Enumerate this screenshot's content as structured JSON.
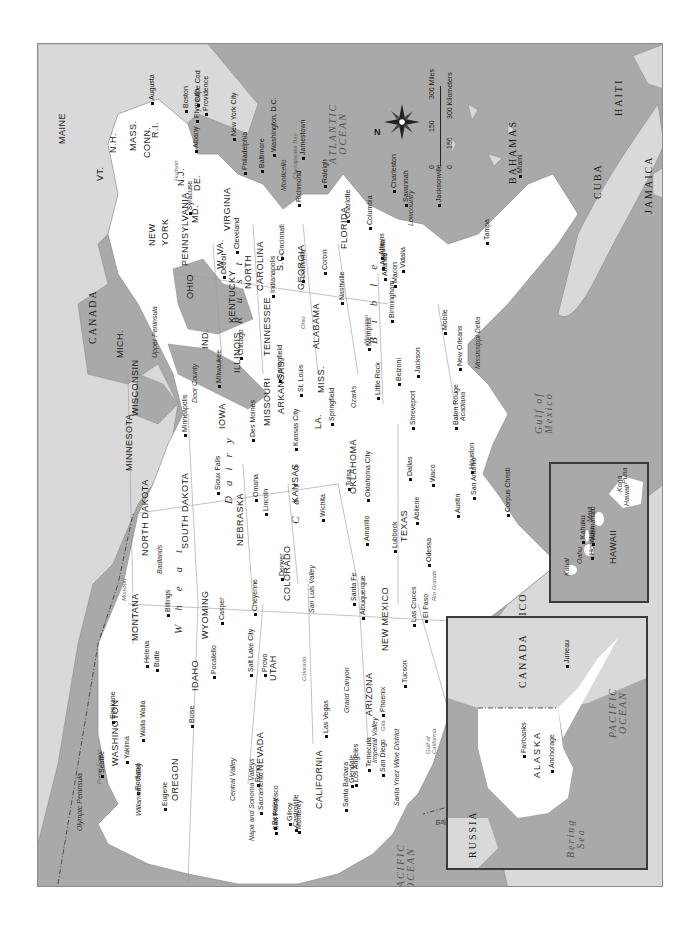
{
  "map": {
    "title": "United States regional map",
    "orientation": "rotated 90 degrees counter-clockwise (north points left)",
    "colors": {
      "water": "#a9a9a9",
      "foreign_land": "#d9d9d9",
      "us_land": "#ffffff",
      "border": "#8c8c8c",
      "text": "#1a1a1a"
    },
    "compass": {
      "north_label": "N"
    },
    "scale": {
      "miles_ticks": [
        "0",
        "150",
        "300 Miles"
      ],
      "km_ticks": [
        "0",
        "150",
        "300 Kilometers"
      ]
    },
    "countries": {
      "canada": "CANADA",
      "mexico": "MEXICO",
      "bahamas": "BAHAMAS",
      "cuba": "CUBA",
      "haiti": "HAITI",
      "jamaica": "JAMAICA",
      "sonora": "SONORA",
      "baja": "Baja California"
    },
    "water_bodies": {
      "atlantic": [
        "ATLANTIC",
        "OCEAN"
      ],
      "pacific": [
        "PACIFIC",
        "OCEAN"
      ],
      "gulf": [
        "Gulf of",
        "Mexico"
      ],
      "gulf_california": [
        "Gulf of",
        "California"
      ],
      "chesapeake": "Chesapeake Bay",
      "puget": "Puget Sound"
    },
    "states": [
      {
        "name": "MAINE",
        "x": 57,
        "y": 143
      },
      {
        "name": "VT.",
        "x": 95,
        "y": 180
      },
      {
        "name": "N.H.",
        "x": 108,
        "y": 152
      },
      {
        "name": "MASS.",
        "x": 128,
        "y": 150
      },
      {
        "name": "CONN.",
        "x": 142,
        "y": 157
      },
      {
        "name": "R.I.",
        "x": 150,
        "y": 137
      },
      {
        "name": "NEW",
        "x": 147,
        "y": 245
      },
      {
        "name": "YORK",
        "x": 160,
        "y": 245
      },
      {
        "name": "PENNSYLVANIA",
        "x": 180,
        "y": 265
      },
      {
        "name": "N.J.",
        "x": 176,
        "y": 185
      },
      {
        "name": "DE.",
        "x": 192,
        "y": 190
      },
      {
        "name": "MD.",
        "x": 190,
        "y": 222
      },
      {
        "name": "W. VA.",
        "x": 215,
        "y": 268
      },
      {
        "name": "VIRGINIA",
        "x": 222,
        "y": 230
      },
      {
        "name": "OHIO",
        "x": 185,
        "y": 298
      },
      {
        "name": "MICH.",
        "x": 115,
        "y": 357
      },
      {
        "name": "IND.",
        "x": 200,
        "y": 348
      },
      {
        "name": "ILLINOIS",
        "x": 232,
        "y": 372
      },
      {
        "name": "WISCONSIN",
        "x": 130,
        "y": 415
      },
      {
        "name": "MINNESOTA",
        "x": 124,
        "y": 470
      },
      {
        "name": "IOWA",
        "x": 217,
        "y": 428
      },
      {
        "name": "MISSOURI",
        "x": 262,
        "y": 425
      },
      {
        "name": "KENTUCKY",
        "x": 227,
        "y": 322
      },
      {
        "name": "TENNESSEE",
        "x": 262,
        "y": 355
      },
      {
        "name": "NORTH",
        "x": 243,
        "y": 288
      },
      {
        "name": "CAROLINA",
        "x": 255,
        "y": 290
      },
      {
        "name": "S.C.",
        "x": 275,
        "y": 270
      },
      {
        "name": "GEORGIA",
        "x": 296,
        "y": 289
      },
      {
        "name": "ALABAMA",
        "x": 311,
        "y": 348
      },
      {
        "name": "MISS.",
        "x": 316,
        "y": 392
      },
      {
        "name": "ARKANSAS",
        "x": 276,
        "y": 413
      },
      {
        "name": "LA.",
        "x": 313,
        "y": 428
      },
      {
        "name": "FLORIDA",
        "x": 339,
        "y": 248
      },
      {
        "name": "NORTH DAKOTA",
        "x": 140,
        "y": 555
      },
      {
        "name": "SOUTH DAKOTA",
        "x": 180,
        "y": 548
      },
      {
        "name": "NEBRASKA",
        "x": 235,
        "y": 545
      },
      {
        "name": "KANSAS",
        "x": 290,
        "y": 502
      },
      {
        "name": "OKLAHOMA",
        "x": 348,
        "y": 493
      },
      {
        "name": "TEXAS",
        "x": 399,
        "y": 541
      },
      {
        "name": "MONTANA",
        "x": 130,
        "y": 640
      },
      {
        "name": "WYOMING",
        "x": 200,
        "y": 638
      },
      {
        "name": "COLORADO",
        "x": 282,
        "y": 600
      },
      {
        "name": "NEW MEXICO",
        "x": 380,
        "y": 650
      },
      {
        "name": "IDAHO",
        "x": 190,
        "y": 690
      },
      {
        "name": "UTAH",
        "x": 268,
        "y": 680
      },
      {
        "name": "ARIZONA",
        "x": 364,
        "y": 715
      },
      {
        "name": "WASHINGTON",
        "x": 110,
        "y": 765
      },
      {
        "name": "OREGON",
        "x": 170,
        "y": 800
      },
      {
        "name": "NEVADA",
        "x": 255,
        "y": 770
      },
      {
        "name": "CALIFORNIA",
        "x": 314,
        "y": 808
      }
    ],
    "cities": [
      {
        "name": "Augusta",
        "x": 147,
        "y": 100
      },
      {
        "name": "Boston",
        "x": 181,
        "y": 108
      },
      {
        "name": "Cape Cod",
        "x": 193,
        "y": 102
      },
      {
        "name": "Plymouth",
        "x": 192,
        "y": 118
      },
      {
        "name": "Providence",
        "x": 201,
        "y": 111
      },
      {
        "name": "New York City",
        "x": 229,
        "y": 136
      },
      {
        "name": "Philadelphia",
        "x": 240,
        "y": 170
      },
      {
        "name": "Baltimore",
        "x": 257,
        "y": 168
      },
      {
        "name": "Washington, D.C.",
        "x": 269,
        "y": 152
      },
      {
        "name": "Jamestown",
        "x": 298,
        "y": 155
      },
      {
        "name": "Albany",
        "x": 191,
        "y": 148
      },
      {
        "name": "Syracuse",
        "x": 185,
        "y": 210
      },
      {
        "name": "Richmond",
        "x": 294,
        "y": 202
      },
      {
        "name": "Raleigh",
        "x": 320,
        "y": 183
      },
      {
        "name": "Charlotte",
        "x": 343,
        "y": 218
      },
      {
        "name": "Columbia",
        "x": 365,
        "y": 225
      },
      {
        "name": "Charleston",
        "x": 389,
        "y": 188
      },
      {
        "name": "Savannah",
        "x": 401,
        "y": 202
      },
      {
        "name": "Jacksonville",
        "x": 434,
        "y": 202
      },
      {
        "name": "Tampa",
        "x": 482,
        "y": 240
      },
      {
        "name": "Miami",
        "x": 515,
        "y": 173
      },
      {
        "name": "Cleveland",
        "x": 232,
        "y": 249
      },
      {
        "name": "Detroit",
        "x": 219,
        "y": 274
      },
      {
        "name": "Cincinnati",
        "x": 277,
        "y": 255
      },
      {
        "name": "Indianapolis",
        "x": 268,
        "y": 293
      },
      {
        "name": "Louisville",
        "x": 298,
        "y": 278
      },
      {
        "name": "Corbin",
        "x": 320,
        "y": 270
      },
      {
        "name": "Nashville",
        "x": 337,
        "y": 300
      },
      {
        "name": "Athens",
        "x": 377,
        "y": 255
      },
      {
        "name": "Augusta",
        "x": 378,
        "y": 265
      },
      {
        "name": "Atlanta",
        "x": 380,
        "y": 276
      },
      {
        "name": "Macon",
        "x": 390,
        "y": 283
      },
      {
        "name": "Vidalia",
        "x": 398,
        "y": 268
      },
      {
        "name": "Birmingham",
        "x": 387,
        "y": 318
      },
      {
        "name": "Mobile",
        "x": 440,
        "y": 330
      },
      {
        "name": "New Orleans",
        "x": 455,
        "y": 366
      },
      {
        "name": "Memphis",
        "x": 364,
        "y": 346
      },
      {
        "name": "Belzoni",
        "x": 394,
        "y": 381
      },
      {
        "name": "Jackson",
        "x": 413,
        "y": 373
      },
      {
        "name": "Little Rock",
        "x": 373,
        "y": 395
      },
      {
        "name": "Shreveport",
        "x": 408,
        "y": 425
      },
      {
        "name": "Baton Rouge",
        "x": 451,
        "y": 425
      },
      {
        "name": "Chicago",
        "x": 236,
        "y": 355
      },
      {
        "name": "Milwaukee",
        "x": 214,
        "y": 383
      },
      {
        "name": "Springfield",
        "x": 275,
        "y": 378
      },
      {
        "name": "St. Louis",
        "x": 296,
        "y": 392
      },
      {
        "name": "Des Moines",
        "x": 248,
        "y": 437
      },
      {
        "name": "Kansas City",
        "x": 291,
        "y": 446
      },
      {
        "name": "Springfield",
        "x": 327,
        "y": 421
      },
      {
        "name": "Minneapolis",
        "x": 180,
        "y": 432
      },
      {
        "name": "Sioux Falls",
        "x": 213,
        "y": 490
      },
      {
        "name": "Omaha",
        "x": 251,
        "y": 497
      },
      {
        "name": "Lincoln",
        "x": 261,
        "y": 511
      },
      {
        "name": "Wichita",
        "x": 318,
        "y": 517
      },
      {
        "name": "Tulsa",
        "x": 344,
        "y": 486
      },
      {
        "name": "Oklahoma City",
        "x": 363,
        "y": 497
      },
      {
        "name": "Dallas",
        "x": 405,
        "y": 476
      },
      {
        "name": "Waco",
        "x": 428,
        "y": 482
      },
      {
        "name": "Houston",
        "x": 467,
        "y": 469
      },
      {
        "name": "San Antonio",
        "x": 469,
        "y": 495
      },
      {
        "name": "Austin",
        "x": 453,
        "y": 513
      },
      {
        "name": "Corpus Christi",
        "x": 503,
        "y": 512
      },
      {
        "name": "Abilene",
        "x": 412,
        "y": 520
      },
      {
        "name": "Lubbock",
        "x": 390,
        "y": 548
      },
      {
        "name": "Amarillo",
        "x": 362,
        "y": 541
      },
      {
        "name": "Odessa",
        "x": 424,
        "y": 562
      },
      {
        "name": "Denver",
        "x": 277,
        "y": 576
      },
      {
        "name": "Santa Fe",
        "x": 349,
        "y": 601
      },
      {
        "name": "Albuquerque",
        "x": 358,
        "y": 615
      },
      {
        "name": "Las Cruces",
        "x": 409,
        "y": 622
      },
      {
        "name": "El Paso",
        "x": 421,
        "y": 618
      },
      {
        "name": "Cheyenne",
        "x": 250,
        "y": 611
      },
      {
        "name": "Casper",
        "x": 217,
        "y": 620
      },
      {
        "name": "Billings",
        "x": 163,
        "y": 612
      },
      {
        "name": "Helena",
        "x": 142,
        "y": 663
      },
      {
        "name": "Butte",
        "x": 152,
        "y": 667
      },
      {
        "name": "Salt Lake City",
        "x": 246,
        "y": 672
      },
      {
        "name": "Provo",
        "x": 260,
        "y": 672
      },
      {
        "name": "Pocatello",
        "x": 209,
        "y": 674
      },
      {
        "name": "Boise",
        "x": 187,
        "y": 723
      },
      {
        "name": "Las Vegas",
        "x": 321,
        "y": 733
      },
      {
        "name": "Phoenix",
        "x": 378,
        "y": 712
      },
      {
        "name": "Tucson",
        "x": 400,
        "y": 683
      },
      {
        "name": "Spokane",
        "x": 108,
        "y": 719
      },
      {
        "name": "Walla Walla",
        "x": 138,
        "y": 737
      },
      {
        "name": "Yakima",
        "x": 122,
        "y": 759
      },
      {
        "name": "Seattle",
        "x": 97,
        "y": 773
      },
      {
        "name": "Portland",
        "x": 133,
        "y": 790
      },
      {
        "name": "Eugene",
        "x": 160,
        "y": 806
      },
      {
        "name": "Reno",
        "x": 253,
        "y": 782
      },
      {
        "name": "Sacramento",
        "x": 256,
        "y": 810
      },
      {
        "name": "Berkeley",
        "x": 270,
        "y": 825
      },
      {
        "name": "San Francisco",
        "x": 271,
        "y": 830
      },
      {
        "name": "Gilroy",
        "x": 285,
        "y": 821
      },
      {
        "name": "Castroville",
        "x": 291,
        "y": 827
      },
      {
        "name": "Monterey",
        "x": 294,
        "y": 829
      },
      {
        "name": "Glendale",
        "x": 347,
        "y": 783
      },
      {
        "name": "Los Angeles",
        "x": 351,
        "y": 782
      },
      {
        "name": "Temecula",
        "x": 364,
        "y": 767
      },
      {
        "name": "Santa Barbara",
        "x": 341,
        "y": 807
      },
      {
        "name": "San Diego",
        "x": 378,
        "y": 772
      }
    ],
    "regions": [
      {
        "name": "Lowcountry",
        "x": 406,
        "y": 225
      },
      {
        "name": "Mississippi Delta",
        "x": 473,
        "y": 368
      },
      {
        "name": "Acadiana",
        "x": 458,
        "y": 420
      },
      {
        "name": "Ozarks",
        "x": 349,
        "y": 407
      },
      {
        "name": "Upper Peninsula",
        "x": 150,
        "y": 357
      },
      {
        "name": "Door County",
        "x": 190,
        "y": 402
      },
      {
        "name": "Badlands",
        "x": 155,
        "y": 573
      },
      {
        "name": "San Luis Valley",
        "x": 307,
        "y": 612
      },
      {
        "name": "Grand Canyon",
        "x": 342,
        "y": 712
      },
      {
        "name": "Imperial Valley",
        "x": 370,
        "y": 762
      },
      {
        "name": "Santa Ynez Wine District",
        "x": 392,
        "y": 805
      },
      {
        "name": "Central Valley",
        "x": 228,
        "y": 800
      },
      {
        "name": "Napa and Sonoma Valleys",
        "x": 247,
        "y": 840
      },
      {
        "name": "Willamette Valley",
        "x": 134,
        "y": 815
      },
      {
        "name": "Olympic Peninsula",
        "x": 75,
        "y": 830
      },
      {
        "name": "Monticello",
        "x": 279,
        "y": 190
      }
    ],
    "rivers": [
      {
        "name": "Hudson",
        "x": 172,
        "y": 180
      },
      {
        "name": "Ohio",
        "x": 299,
        "y": 328
      },
      {
        "name": "Mississippi",
        "x": 362,
        "y": 343
      },
      {
        "name": "Missouri",
        "x": 120,
        "y": 600
      },
      {
        "name": "Colorado",
        "x": 300,
        "y": 680
      },
      {
        "name": "Rio Grande",
        "x": 430,
        "y": 600
      },
      {
        "name": "Gila",
        "x": 379,
        "y": 730
      }
    ],
    "belts": {
      "wheat": "Wheat",
      "corn": "Corn",
      "dairy": "Dairy",
      "rust": "Rust",
      "belt": "Belt",
      "bible": "Bible"
    },
    "insets": {
      "alaska": {
        "state": "ALASKA",
        "cities": [
          "Fairbanks",
          "Anchorage",
          "Juneau"
        ],
        "countries": [
          "RUSSIA",
          "CANADA"
        ],
        "water": [
          "Bering",
          "Sea",
          "PACIFIC",
          "OCEAN"
        ]
      },
      "hawaii": {
        "state": "HAWAII",
        "cities": [
          "Honolulu",
          "Kahuku",
          "Waimanalo"
        ],
        "islands": [
          "Kauai",
          "Oahu",
          "Maui",
          "Hawaii"
        ],
        "places": [
          "Kona",
          "Puna"
        ]
      }
    }
  }
}
